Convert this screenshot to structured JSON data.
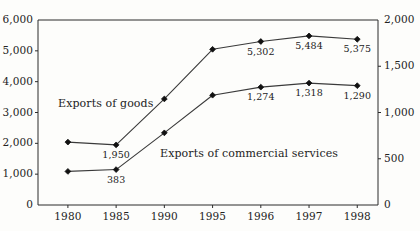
{
  "chart_data": {
    "type": "line",
    "title": "",
    "xlabel": "",
    "categories": [
      "1980",
      "1985",
      "1990",
      "1995",
      "1996",
      "1997",
      "1998"
    ],
    "grid": false,
    "legend_position": "inline-annotation",
    "axes": {
      "left": {
        "label": "",
        "ylim": [
          0,
          6000
        ],
        "ticks": [
          "0",
          "1,000",
          "2,000",
          "3,000",
          "4,000",
          "5,000",
          "6,000"
        ],
        "tick_values": [
          0,
          1000,
          2000,
          3000,
          4000,
          5000,
          6000
        ]
      },
      "right": {
        "label": "",
        "ylim": [
          0,
          2000
        ],
        "ticks": [
          "0",
          "500",
          "1,000",
          "1,500",
          "2,000"
        ],
        "tick_values": [
          0,
          500,
          1000,
          1500,
          2000
        ]
      }
    },
    "series": [
      {
        "name": "Exports of goods",
        "axis": "left",
        "values": [
          2040,
          1950,
          3440,
          5050,
          5302,
          5484,
          5375
        ],
        "point_labels": [
          "",
          "1,950",
          "",
          "",
          "5,302",
          "5,484",
          "5,375"
        ],
        "marker": "diamond"
      },
      {
        "name": "Exports of commercial services",
        "axis": "right",
        "values": [
          363,
          383,
          780,
          1187,
          1274,
          1318,
          1290
        ],
        "point_labels": [
          "",
          "383",
          "",
          "",
          "1,274",
          "1,318",
          "1,290"
        ],
        "marker": "diamond"
      }
    ],
    "annotations": [
      {
        "text": "Exports of goods",
        "x_px": 58,
        "y_px": 98
      },
      {
        "text": "Exports of commercial services",
        "x_px": 160,
        "y_px": 148
      }
    ]
  },
  "colors": {
    "background": "#fdfdfb",
    "axis": "#2b2b2b",
    "series_line": "#3a3a3a",
    "marker": "#111111",
    "text": "#232323"
  }
}
